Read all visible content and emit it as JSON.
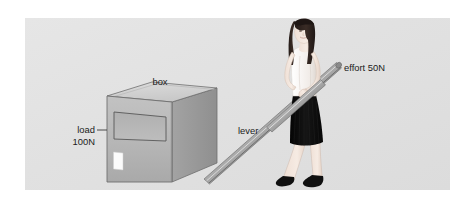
{
  "diagram": {
    "panel": {
      "background_color": "#e2e2e2",
      "page_background_color": "#ffffff"
    },
    "labels": {
      "box": "box",
      "lever": "lever",
      "effort": "effort 50N",
      "load_line1": "load",
      "load_line2": "100N"
    },
    "values": {
      "effort_force": "50N",
      "load_force": "100N"
    },
    "colors": {
      "box_front": "#b5b5b5",
      "box_top": "#d2d2d2",
      "box_side": "#9a9a9a",
      "box_outline": "#6f6f6f",
      "lever_light": "#c9c9c9",
      "lever_dark": "#6d6d6d",
      "skirt": "#111111",
      "shoe": "#101010",
      "hair": "#2e2320",
      "skin": "#f3e6de",
      "top": "#f7f4f1",
      "label_text": "#1b1b1b",
      "leader_line": "#3a3a3a"
    },
    "parts": {
      "box": "box",
      "lever": "lever",
      "person": "person",
      "fulcrum": "fulcrum",
      "sticker": "white-sticker",
      "panel_label": "front-panel-recess"
    }
  }
}
